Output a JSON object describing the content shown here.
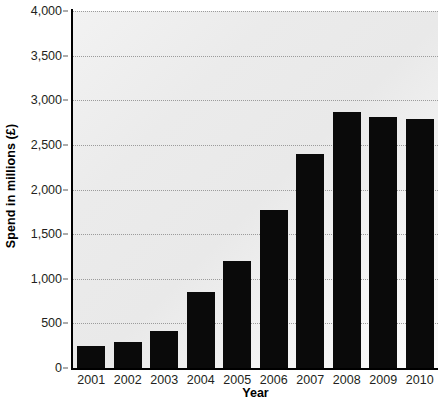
{
  "chart_data": {
    "type": "bar",
    "title": "",
    "subtitle": "",
    "xlabel": "Year",
    "ylabel": "Spend in millions (£)",
    "categories": [
      "2001",
      "2002",
      "2003",
      "2004",
      "2005",
      "2006",
      "2007",
      "2008",
      "2009",
      "2010"
    ],
    "values": [
      250,
      290,
      420,
      850,
      1200,
      1770,
      2400,
      2870,
      2810,
      2790
    ],
    "series": [
      {
        "name": "Spend",
        "values": [
          250,
          290,
          420,
          850,
          1200,
          1770,
          2400,
          2870,
          2810,
          2790
        ]
      }
    ],
    "ylim": [
      0,
      4000
    ],
    "y_ticks": [
      0,
      500,
      1000,
      1500,
      2000,
      2500,
      3000,
      3500,
      4000
    ],
    "y_tick_labels": [
      "0",
      "500",
      "1,000",
      "1,500",
      "2,000",
      "2,500",
      "3,000",
      "3,500",
      "4,000"
    ],
    "grid": true,
    "grid_axis": "y",
    "legend": false,
    "legend_position": "none",
    "bar_color": "#0a0a0a",
    "plot_background": "#ebebeb",
    "gridline_color": "#9b9b9b",
    "axis_color": "#000000",
    "text_color": "#231f20"
  }
}
